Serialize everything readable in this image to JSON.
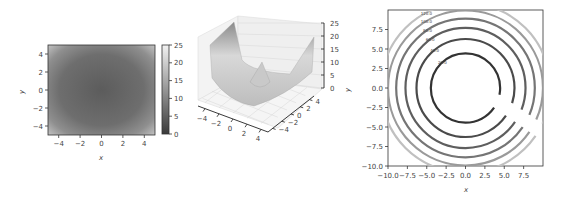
{
  "chart_data": [
    {
      "type": "heatmap",
      "title": "",
      "function": "z = x^2 + y^2",
      "xlabel": "x",
      "ylabel": "y",
      "xlim": [
        -5,
        5
      ],
      "ylim": [
        -5,
        5
      ],
      "xticks": [
        "-4",
        "-2",
        "0",
        "2",
        "4"
      ],
      "yticks": [
        "-4",
        "-2",
        "0",
        "2",
        "4"
      ],
      "colorbar": {
        "min": 0,
        "max": 25,
        "ticks": [
          "0",
          "5",
          "10",
          "15",
          "20",
          "25"
        ],
        "colormap": "gray"
      }
    },
    {
      "type": "surface3d",
      "title": "",
      "function": "z = x^2 + y^2",
      "xlim": [
        -5,
        5
      ],
      "ylim": [
        -5,
        5
      ],
      "zlim": [
        0,
        25
      ],
      "xticks": [
        "-4",
        "-2",
        "0",
        "2",
        "4"
      ],
      "yticks": [
        "-4",
        "-2",
        "0",
        "2",
        "4"
      ],
      "zticks": [
        "0",
        "5",
        "10",
        "15",
        "20",
        "25"
      ]
    },
    {
      "type": "contour",
      "title": "",
      "function": "z = x^2 + y^2",
      "xlabel": "x",
      "ylabel": "y",
      "xlim": [
        -10,
        10
      ],
      "ylim": [
        -10,
        10
      ],
      "xticks": [
        "-10.0",
        "-7.5",
        "-5.0",
        "-2.5",
        "0.0",
        "2.5",
        "5.0",
        "7.5"
      ],
      "yticks": [
        "-10.0",
        "-7.5",
        "-5.0",
        "-2.5",
        "0.0",
        "2.5",
        "5.0",
        "7.5"
      ],
      "levels": [
        20,
        40,
        60,
        80,
        100,
        120
      ],
      "level_labels": [
        "20.0",
        "40.0",
        "60.0",
        "80.0",
        "100.0",
        "120.0"
      ]
    }
  ],
  "labels": {
    "heat_x": "x",
    "heat_y": "y",
    "contour_x": "x",
    "contour_y": "y"
  }
}
